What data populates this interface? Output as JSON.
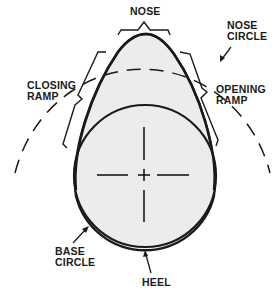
{
  "diagram": {
    "colors": {
      "line": "#1a1a1a",
      "fill": "#ececec",
      "background": "#ffffff"
    },
    "labels": {
      "nose": {
        "line1": "NOSE"
      },
      "nose_circle": {
        "line1": "NOSE",
        "line2": "CIRCLE"
      },
      "closing_ramp": {
        "line1": "CLOSING",
        "line2": "RAMP"
      },
      "opening_ramp": {
        "line1": "OPENING",
        "line2": "RAMP"
      },
      "base_circle": {
        "line1": "BASE",
        "line2": "CIRCLE"
      },
      "heel": {
        "line1": "HEEL"
      }
    }
  }
}
